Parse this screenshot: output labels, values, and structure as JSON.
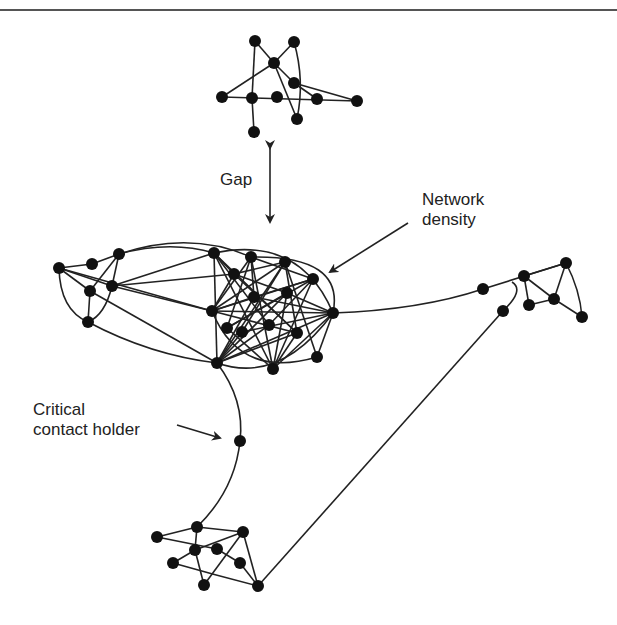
{
  "diagram": {
    "labels": {
      "gap": "Gap",
      "network_density_line1": "Network",
      "network_density_line2": "density",
      "critical_line1": "Critical",
      "critical_line2": "contact holder"
    },
    "colors": {
      "node": "#111111",
      "edge": "#222222",
      "rule": "#555555"
    },
    "clusters": [
      {
        "name": "top-cluster",
        "nodes": [
          [
            255,
            41
          ],
          [
            294,
            42
          ],
          [
            274,
            63
          ],
          [
            294,
            83
          ],
          [
            222,
            97
          ],
          [
            252,
            98
          ],
          [
            277,
            97
          ],
          [
            317,
            99
          ],
          [
            357,
            101
          ],
          [
            297,
            119
          ],
          [
            254,
            132
          ]
        ]
      },
      {
        "name": "main-cluster",
        "nodes": [
          [
            59,
            268
          ],
          [
            92,
            264
          ],
          [
            119,
            254
          ],
          [
            90,
            291
          ],
          [
            112,
            286
          ],
          [
            88,
            322
          ],
          [
            214,
            253
          ],
          [
            251,
            257
          ],
          [
            285,
            262
          ],
          [
            313,
            279
          ],
          [
            234,
            274
          ],
          [
            254,
            297
          ],
          [
            287,
            293
          ],
          [
            212,
            311
          ],
          [
            333,
            313
          ],
          [
            227,
            328
          ],
          [
            242,
            332
          ],
          [
            269,
            325
          ],
          [
            297,
            333
          ],
          [
            217,
            363
          ],
          [
            273,
            369
          ],
          [
            317,
            357
          ]
        ]
      },
      {
        "name": "critical-contact",
        "nodes": [
          [
            240,
            441
          ]
        ]
      },
      {
        "name": "right-cluster",
        "nodes": [
          [
            483,
            289
          ],
          [
            524,
            276
          ],
          [
            566,
            263
          ],
          [
            529,
            305
          ],
          [
            554,
            299
          ],
          [
            503,
            311
          ],
          [
            582,
            317
          ]
        ]
      },
      {
        "name": "bottom-cluster",
        "nodes": [
          [
            197,
            527
          ],
          [
            157,
            537
          ],
          [
            243,
            532
          ],
          [
            195,
            550
          ],
          [
            217,
            549
          ],
          [
            173,
            563
          ],
          [
            240,
            563
          ],
          [
            204,
            585
          ],
          [
            258,
            586
          ]
        ]
      }
    ]
  }
}
